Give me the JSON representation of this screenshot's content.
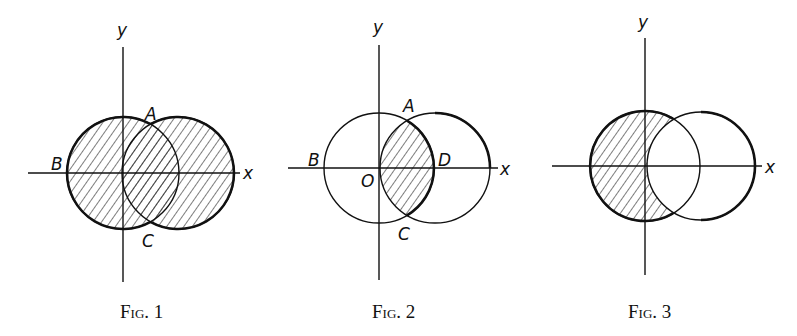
{
  "figures": [
    {
      "id": "fig1",
      "caption": "Fig. 1",
      "axis_labels": {
        "x": "x",
        "y": "y"
      },
      "points": {
        "A": "A",
        "B": "B",
        "C": "C"
      },
      "shading": "union of both circles"
    },
    {
      "id": "fig2",
      "caption": "Fig. 2",
      "axis_labels": {
        "x": "x",
        "y": "y"
      },
      "points": {
        "A": "A",
        "B": "B",
        "C": "C",
        "D": "D",
        "O": "O"
      },
      "shading": "intersection of both circles"
    },
    {
      "id": "fig3",
      "caption": "Fig. 3",
      "axis_labels": {
        "x": "x",
        "y": "y"
      },
      "points": {},
      "shading": "left circle minus right circle"
    }
  ]
}
